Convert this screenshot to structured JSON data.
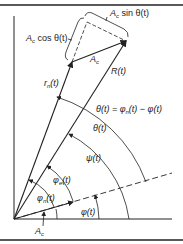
{
  "diagram": {
    "type": "phasor-diagram",
    "colors": {
      "ink": "#222222",
      "background": "#ffffff"
    },
    "labels": {
      "ac_sin": "A",
      "ac_sin_sub": "c",
      "ac_sin_rest": " sin θ(t)",
      "ac_cos": "A",
      "ac_cos_sub": "c",
      "ac_cos_rest": " cos θ(t)",
      "ac_vec": "A",
      "ac_vec_sub": "c",
      "R": "R(t)",
      "rn": "r",
      "rn_sub": "n",
      "rn_rest": "(t)",
      "theta_eq": "θ(t) = φ",
      "theta_eq_sub": "n",
      "theta_eq_rest": "(t) − φ(t)",
      "theta": "θ(t)",
      "psi": "ψ(t)",
      "phi_e": "φ",
      "phi_e_sub": "e",
      "phi_e_rest": "(t)",
      "phi_n": "φ",
      "phi_n_sub": "n",
      "phi_n_rest": "(t)",
      "phi": "φ(t)",
      "ac_bottom": "A",
      "ac_bottom_sub": "c"
    }
  }
}
